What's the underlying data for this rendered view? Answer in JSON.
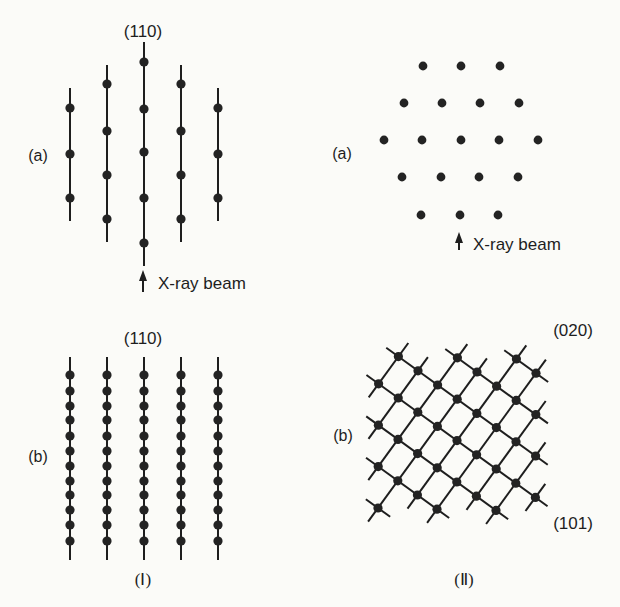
{
  "colors": {
    "background": "#fbfbf8",
    "ink": "#1e1e1e",
    "dot": "#232323"
  },
  "panel_I": {
    "caption": "(Ⅰ)",
    "a": {
      "label": "(a)",
      "direction_label": "(110)",
      "beam_label": "X-ray beam",
      "rows": [
        {
          "x": 70,
          "y1": 88,
          "y2": 221,
          "dots": [
            108,
            154,
            198
          ]
        },
        {
          "x": 107,
          "y1": 65,
          "y2": 242,
          "dots": [
            84,
            131,
            175,
            219
          ]
        },
        {
          "x": 144,
          "y1": 42,
          "y2": 266,
          "dots": [
            62,
            109,
            152,
            198,
            243
          ]
        },
        {
          "x": 181,
          "y1": 65,
          "y2": 242,
          "dots": [
            84,
            131,
            175,
            219
          ]
        },
        {
          "x": 218,
          "y1": 88,
          "y2": 221,
          "dots": [
            108,
            154,
            198
          ]
        }
      ]
    },
    "b": {
      "label": "(b)",
      "direction_label": "(110)",
      "rows": [
        {
          "x": 70,
          "y1": 357,
          "y2": 560
        },
        {
          "x": 107,
          "y1": 357,
          "y2": 560
        },
        {
          "x": 144,
          "y1": 357,
          "y2": 560
        },
        {
          "x": 181,
          "y1": 357,
          "y2": 560
        },
        {
          "x": 218,
          "y1": 357,
          "y2": 560
        }
      ],
      "dot_y": [
        375,
        391,
        406,
        420,
        436,
        451,
        466,
        481,
        495,
        510,
        525,
        541
      ]
    }
  },
  "panel_II": {
    "caption": "(Ⅱ)",
    "a": {
      "label": "(a)",
      "beam_label": "X-ray beam",
      "hex_rows": [
        {
          "y": 66,
          "x": [
            423,
            461,
            500
          ]
        },
        {
          "y": 103,
          "x": [
            404,
            442,
            480,
            519
          ]
        },
        {
          "y": 140,
          "x": [
            384,
            422,
            461,
            499,
            538
          ]
        },
        {
          "y": 177,
          "x": [
            402,
            441,
            479,
            518
          ]
        },
        {
          "y": 215,
          "x": [
            421,
            460,
            498
          ]
        }
      ]
    },
    "b": {
      "label": "(b)",
      "label_upper": "(020)",
      "label_lower": "(101)",
      "lattice": {
        "origin": [
          378,
          508
        ],
        "u": [
          19.6,
          14.2
        ],
        "v": [
          19.8,
          -27.2
        ],
        "nodes": [
          [
            -3,
            4
          ],
          [
            -1,
            5
          ],
          [
            1,
            6
          ],
          [
            -3,
            3
          ],
          [
            -2,
            4
          ],
          [
            -1,
            4
          ],
          [
            0,
            5
          ],
          [
            1,
            5
          ],
          [
            2,
            6
          ],
          [
            -2,
            3
          ],
          [
            0,
            4
          ],
          [
            2,
            5
          ],
          [
            -1,
            3
          ],
          [
            1,
            4
          ],
          [
            3,
            5
          ],
          [
            -2,
            2
          ],
          [
            0,
            3
          ],
          [
            2,
            4
          ],
          [
            -1,
            2
          ],
          [
            1,
            3
          ],
          [
            3,
            4
          ],
          [
            0,
            2
          ],
          [
            2,
            3
          ],
          [
            4,
            4
          ],
          [
            -1,
            1
          ],
          [
            1,
            2
          ],
          [
            3,
            3
          ],
          [
            0,
            1
          ],
          [
            2,
            2
          ],
          [
            4,
            3
          ],
          [
            1,
            1
          ],
          [
            3,
            2
          ],
          [
            5,
            3
          ],
          [
            0,
            0
          ],
          [
            2,
            1
          ],
          [
            4,
            2
          ]
        ]
      }
    }
  }
}
